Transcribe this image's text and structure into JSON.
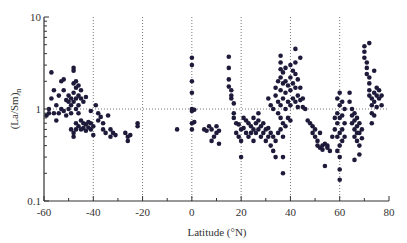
{
  "chart_data": {
    "type": "scatter",
    "title": "",
    "xlabel": "Latitude (°N)",
    "ylabel": "(La/Sm)n",
    "ylabel_main": "(La/Sm)",
    "ylabel_sub": "n",
    "xlim": [
      -60,
      80
    ],
    "ylim": [
      0.1,
      10
    ],
    "yscale": "log",
    "x_ticks": [
      -60,
      -40,
      -20,
      0,
      20,
      40,
      60,
      80
    ],
    "x_tick_labels": [
      "-60",
      "-40",
      "-20",
      "0",
      "20",
      "40",
      "60",
      "80"
    ],
    "y_ticks": [
      0.1,
      1,
      10
    ],
    "y_tick_labels": [
      "0.1",
      "1",
      "10"
    ],
    "grid": {
      "vertical_dotted_at": [
        -40,
        -20,
        0,
        20,
        40,
        60
      ],
      "horizontal_dotted_at": [
        1
      ]
    },
    "marker_color": "#1e1a3a",
    "series": [
      {
        "name": "samples",
        "points": [
          [
            -59,
            0.85
          ],
          [
            -58,
            0.9
          ],
          [
            -58,
            1.0
          ],
          [
            -57,
            2.5
          ],
          [
            -57,
            1.3
          ],
          [
            -56,
            0.9
          ],
          [
            -56,
            1.6
          ],
          [
            -55,
            1.1
          ],
          [
            -55,
            0.75
          ],
          [
            -54,
            0.9
          ],
          [
            -54,
            1.4
          ],
          [
            -53,
            2.0
          ],
          [
            -53,
            1.0
          ],
          [
            -52,
            2.1
          ],
          [
            -52,
            1.6
          ],
          [
            -52,
            0.95
          ],
          [
            -51,
            1.25
          ],
          [
            -51,
            0.85
          ],
          [
            -50,
            1.2
          ],
          [
            -50,
            1.4
          ],
          [
            -50,
            1.0
          ],
          [
            -49,
            1.3
          ],
          [
            -49,
            1.1
          ],
          [
            -49,
            0.9
          ],
          [
            -49,
            0.6
          ],
          [
            -48,
            2.8
          ],
          [
            -48,
            2.6
          ],
          [
            -48,
            1.9
          ],
          [
            -48,
            1.5
          ],
          [
            -48,
            1.2
          ],
          [
            -48,
            0.55
          ],
          [
            -48,
            0.5
          ],
          [
            -47,
            2.0
          ],
          [
            -47,
            1.7
          ],
          [
            -47,
            1.3
          ],
          [
            -47,
            1.0
          ],
          [
            -47,
            0.7
          ],
          [
            -47,
            0.6
          ],
          [
            -46,
            1.8
          ],
          [
            -46,
            1.4
          ],
          [
            -46,
            1.1
          ],
          [
            -46,
            0.9
          ],
          [
            -46,
            0.65
          ],
          [
            -45,
            1.6
          ],
          [
            -45,
            1.3
          ],
          [
            -45,
            0.75
          ],
          [
            -45,
            0.6
          ],
          [
            -44,
            1.2
          ],
          [
            -44,
            0.7
          ],
          [
            -44,
            0.62
          ],
          [
            -43,
            0.68
          ],
          [
            -43,
            0.58
          ],
          [
            -42,
            0.72
          ],
          [
            -42,
            0.63
          ],
          [
            -41,
            0.7
          ],
          [
            -41,
            0.6
          ],
          [
            -40,
            0.65
          ],
          [
            -40,
            0.52
          ],
          [
            -43,
            1.35
          ],
          [
            -41,
            0.95
          ],
          [
            -39,
            1.1
          ],
          [
            -38,
            0.9
          ],
          [
            -38,
            0.75
          ],
          [
            -37,
            0.82
          ],
          [
            -36,
            0.6
          ],
          [
            -36,
            0.7
          ],
          [
            -35,
            0.55
          ],
          [
            -34,
            0.85
          ],
          [
            -33,
            0.6
          ],
          [
            -33,
            0.5
          ],
          [
            -32,
            0.55
          ],
          [
            -31,
            0.52
          ],
          [
            -27,
            0.55
          ],
          [
            -26,
            0.5
          ],
          [
            -26,
            0.45
          ],
          [
            -25,
            0.52
          ],
          [
            -22,
            0.7
          ],
          [
            -22,
            0.65
          ],
          [
            -6,
            0.6
          ],
          [
            0,
            3.6
          ],
          [
            0,
            3.0
          ],
          [
            0,
            2.0
          ],
          [
            0,
            1.5
          ],
          [
            0,
            1.0
          ],
          [
            0,
            0.95
          ],
          [
            0,
            0.7
          ],
          [
            0,
            0.6
          ],
          [
            1,
            0.98
          ],
          [
            1,
            0.72
          ],
          [
            5,
            0.6
          ],
          [
            6,
            0.58
          ],
          [
            7,
            0.65
          ],
          [
            8,
            0.6
          ],
          [
            8,
            0.45
          ],
          [
            9,
            0.5
          ],
          [
            10,
            0.55
          ],
          [
            10,
            0.65
          ],
          [
            11,
            0.58
          ],
          [
            11,
            0.42
          ],
          [
            15,
            3.7
          ],
          [
            15,
            2.8
          ],
          [
            15,
            2.1
          ],
          [
            15,
            1.75
          ],
          [
            16,
            1.6
          ],
          [
            16,
            1.4
          ],
          [
            16,
            1.3
          ],
          [
            17,
            1.15
          ],
          [
            17,
            0.9
          ],
          [
            17,
            0.8
          ],
          [
            18,
            0.7
          ],
          [
            18,
            0.55
          ],
          [
            19,
            0.68
          ],
          [
            19,
            0.5
          ],
          [
            20,
            0.6
          ],
          [
            20,
            0.45
          ],
          [
            20,
            0.3
          ],
          [
            21,
            0.62
          ],
          [
            21,
            0.8
          ],
          [
            22,
            0.55
          ],
          [
            22,
            0.75
          ],
          [
            23,
            0.7
          ],
          [
            23,
            0.5
          ],
          [
            24,
            0.65
          ],
          [
            24,
            0.55
          ],
          [
            25,
            0.8
          ],
          [
            25,
            0.6
          ],
          [
            25,
            0.45
          ],
          [
            26,
            0.7
          ],
          [
            26,
            0.55
          ],
          [
            27,
            0.9
          ],
          [
            27,
            0.75
          ],
          [
            27,
            0.6
          ],
          [
            28,
            0.65
          ],
          [
            28,
            0.5
          ],
          [
            29,
            0.7
          ],
          [
            29,
            0.55
          ],
          [
            30,
            0.6
          ],
          [
            30,
            0.45
          ],
          [
            31,
            0.62
          ],
          [
            31,
            0.5
          ],
          [
            32,
            0.55
          ],
          [
            32,
            0.4
          ],
          [
            33,
            0.5
          ],
          [
            33,
            0.35
          ],
          [
            34,
            0.45
          ],
          [
            34,
            0.3
          ],
          [
            35,
            0.55
          ],
          [
            31,
            1.3
          ],
          [
            32,
            1.1
          ],
          [
            33,
            1.0
          ],
          [
            34,
            1.4
          ],
          [
            34,
            1.7
          ],
          [
            35,
            2.0
          ],
          [
            35,
            1.2
          ],
          [
            35,
            0.9
          ],
          [
            36,
            3.8
          ],
          [
            36,
            3.2
          ],
          [
            36,
            2.7
          ],
          [
            36,
            2.2
          ],
          [
            36,
            1.6
          ],
          [
            36,
            1.1
          ],
          [
            36,
            0.8
          ],
          [
            36,
            0.6
          ],
          [
            37,
            2.5
          ],
          [
            37,
            1.9
          ],
          [
            37,
            1.3
          ],
          [
            37,
            0.7
          ],
          [
            37,
            0.5
          ],
          [
            37,
            0.3
          ],
          [
            37,
            0.2
          ],
          [
            38,
            2.0
          ],
          [
            38,
            1.5
          ],
          [
            38,
            1.0
          ],
          [
            38,
            0.65
          ],
          [
            39,
            1.8
          ],
          [
            39,
            1.2
          ],
          [
            39,
            0.8
          ],
          [
            40,
            3.0
          ],
          [
            40,
            2.2
          ],
          [
            40,
            1.6
          ],
          [
            40,
            1.1
          ],
          [
            40,
            0.75
          ],
          [
            41,
            2.6
          ],
          [
            41,
            1.9
          ],
          [
            41,
            1.3
          ],
          [
            42,
            3.2
          ],
          [
            42,
            2.4
          ],
          [
            42,
            1.7
          ],
          [
            42,
            1.2
          ],
          [
            43,
            2.1
          ],
          [
            43,
            1.4
          ],
          [
            43,
            1.05
          ],
          [
            44,
            1.7
          ],
          [
            44,
            1.25
          ],
          [
            45,
            1.3
          ],
          [
            45,
            1.05
          ],
          [
            46,
            1.0
          ],
          [
            42,
            4.5
          ],
          [
            44,
            3.6
          ],
          [
            38,
            2.8
          ],
          [
            47,
            0.75
          ],
          [
            48,
            0.7
          ],
          [
            49,
            0.65
          ],
          [
            49,
            0.55
          ],
          [
            50,
            0.6
          ],
          [
            50,
            0.5
          ],
          [
            51,
            0.45
          ],
          [
            51,
            0.4
          ],
          [
            52,
            0.55
          ],
          [
            52,
            0.38
          ],
          [
            53,
            0.4
          ],
          [
            53,
            0.36
          ],
          [
            54,
            0.42
          ],
          [
            55,
            0.38
          ],
          [
            55,
            0.4
          ],
          [
            54,
            0.24
          ],
          [
            57,
            0.5
          ],
          [
            56,
            0.35
          ],
          [
            58,
            0.8
          ],
          [
            58,
            0.6
          ],
          [
            59,
            1.3
          ],
          [
            59,
            0.9
          ],
          [
            59,
            0.7
          ],
          [
            59,
            0.5
          ],
          [
            59,
            0.35
          ],
          [
            60,
            1.5
          ],
          [
            60,
            1.1
          ],
          [
            60,
            0.8
          ],
          [
            60,
            0.55
          ],
          [
            60,
            0.4
          ],
          [
            60,
            0.3
          ],
          [
            60,
            0.22
          ],
          [
            60,
            0.17
          ],
          [
            61,
            1.2
          ],
          [
            61,
            0.85
          ],
          [
            61,
            0.6
          ],
          [
            61,
            0.45
          ],
          [
            62,
            1.0
          ],
          [
            62,
            0.7
          ],
          [
            62,
            0.5
          ],
          [
            64,
            1.5
          ],
          [
            64,
            1.2
          ],
          [
            65,
            1.0
          ],
          [
            65,
            0.85
          ],
          [
            65,
            0.7
          ],
          [
            66,
            0.9
          ],
          [
            66,
            0.75
          ],
          [
            66,
            0.6
          ],
          [
            66,
            0.5
          ],
          [
            67,
            0.8
          ],
          [
            67,
            0.65
          ],
          [
            67,
            0.55
          ],
          [
            67,
            0.45
          ],
          [
            68,
            0.7
          ],
          [
            68,
            0.55
          ],
          [
            68,
            0.4
          ],
          [
            68,
            0.32
          ],
          [
            69,
            0.6
          ],
          [
            69,
            0.48
          ],
          [
            66,
            0.28
          ],
          [
            70,
            4.8
          ],
          [
            70,
            4.2
          ],
          [
            70,
            3.6
          ],
          [
            71,
            3.2
          ],
          [
            71,
            2.8
          ],
          [
            71,
            2.4
          ],
          [
            72,
            2.2
          ],
          [
            72,
            1.9
          ],
          [
            72,
            1.6
          ],
          [
            72,
            1.4
          ],
          [
            73,
            1.3
          ],
          [
            73,
            1.1
          ],
          [
            73,
            0.9
          ],
          [
            73,
            0.7
          ],
          [
            74,
            1.5
          ],
          [
            74,
            1.2
          ],
          [
            74,
            0.85
          ],
          [
            75,
            1.7
          ],
          [
            75,
            1.4
          ],
          [
            75,
            1.05
          ],
          [
            76,
            1.3
          ],
          [
            76,
            1.6
          ],
          [
            77,
            1.4
          ],
          [
            77,
            1.1
          ],
          [
            72,
            5.2
          ],
          [
            74,
            2.6
          ]
        ]
      }
    ]
  }
}
